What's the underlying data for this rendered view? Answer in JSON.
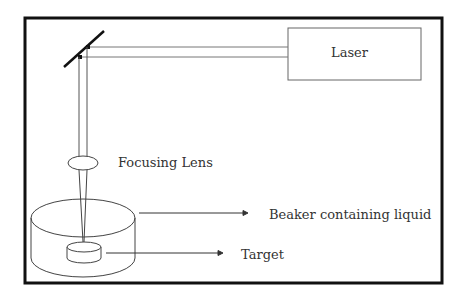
{
  "diagram": {
    "labels": {
      "laser": "Laser",
      "focusing_lens": "Focusing Lens",
      "beaker": "Beaker containing liquid",
      "target": "Target"
    },
    "components": [
      "laser",
      "mirror",
      "beam",
      "focusing lens",
      "beaker containing liquid",
      "target"
    ],
    "colors": {
      "frame": "#111111",
      "lines": "#555555",
      "text": "#333333",
      "background": "#ffffff"
    }
  }
}
